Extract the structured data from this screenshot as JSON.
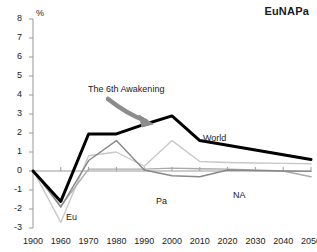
{
  "title": "EuNAPa",
  "unit": "%",
  "annotation": "The 6th Awakening",
  "labels": {
    "world": "World",
    "eu": "Eu",
    "na": "NA",
    "pa": "Pa"
  },
  "colors": {
    "world": "#000000",
    "eu": "#c8c8c8",
    "na": "#888888",
    "pa": "#aaaaaa",
    "axis": "#999999",
    "arrow": "#8c8c8c",
    "text": "#222222"
  },
  "chart_data": {
    "type": "line",
    "title": "EuNAPa",
    "xlabel": "",
    "ylabel": "%",
    "ylim": [
      -3,
      8
    ],
    "yticks": [
      -3,
      -2,
      -1,
      0,
      1,
      2,
      3,
      4,
      5,
      6,
      7,
      8
    ],
    "grid": false,
    "legend": "inline-labels",
    "annotations": [
      {
        "text": "The 6th Awakening",
        "points_to": "world-peak-2000"
      }
    ],
    "categories": [
      1900,
      1960,
      1970,
      1980,
      1990,
      2000,
      2010,
      2020,
      2030,
      2040,
      2050
    ],
    "xtick_labels": [
      "1900",
      "1960",
      "1970",
      "1980",
      "1990",
      "2000",
      "2010",
      "2020",
      "2030",
      "2040",
      "2050"
    ],
    "series": [
      {
        "name": "World",
        "color": "#000000",
        "width": 3,
        "values": [
          0.0,
          -1.6,
          1.95,
          1.95,
          2.45,
          2.9,
          1.6,
          1.35,
          1.1,
          0.85,
          0.6
        ]
      },
      {
        "name": "Eu",
        "color": "#c8c8c8",
        "width": 1.4,
        "values": [
          0.05,
          -2.7,
          0.8,
          1.0,
          0.25,
          1.6,
          0.5,
          0.45,
          0.42,
          0.4,
          0.38
        ]
      },
      {
        "name": "NA",
        "color": "#888888",
        "width": 1.4,
        "values": [
          0.05,
          -1.9,
          0.55,
          1.6,
          0.05,
          -0.25,
          -0.3,
          0.05,
          0.02,
          0.0,
          -0.02
        ]
      },
      {
        "name": "Pa",
        "color": "#aaaaaa",
        "width": 1.4,
        "values": [
          0.0,
          -1.85,
          0.1,
          0.1,
          0.1,
          0.15,
          0.12,
          0.1,
          0.05,
          0.0,
          -0.3
        ]
      }
    ]
  }
}
